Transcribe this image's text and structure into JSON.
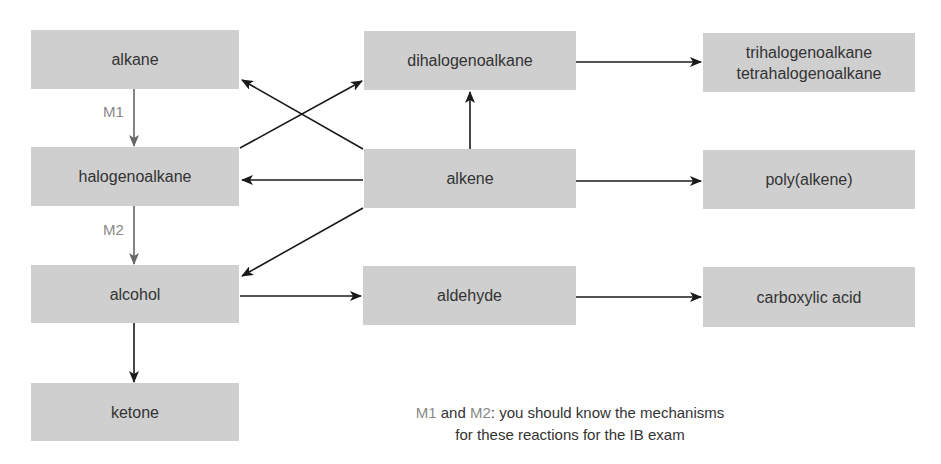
{
  "nodes": {
    "alkane": "alkane",
    "halogenoalkane": "halogenoalkane",
    "alcohol": "alcohol",
    "ketone": "ketone",
    "dihalogenoalkane": "dihalogenoalkane",
    "alkene": "alkene",
    "aldehyde": "aldehyde",
    "trihalogenoalkane": "trihalogenoalkane",
    "tetrahalogenoalkane": "tetrahalogenoalkane",
    "polyalkene": "poly(alkene)",
    "carboxylic_acid": "carboxylic acid"
  },
  "labels": {
    "m1": "M1",
    "m2": "M2"
  },
  "note": {
    "m1": "M1",
    "and": " and ",
    "m2": "M2",
    "line1_rest": ": you should know the mechanisms",
    "line2": "for these reactions for the IB exam"
  },
  "colors": {
    "box": "#cfcfcf",
    "arrow": "#1a1a1a",
    "mechanism_arrow": "#666666"
  }
}
